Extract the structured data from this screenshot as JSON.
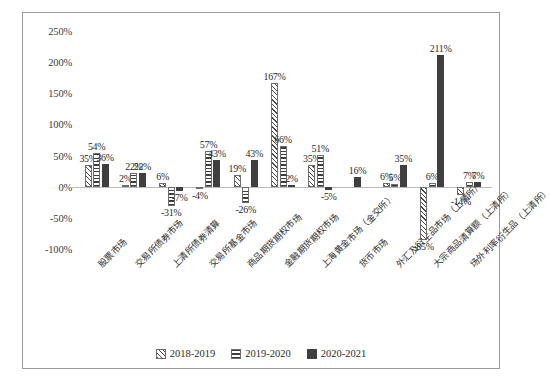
{
  "chart_data": {
    "type": "bar",
    "title": "",
    "subtitle": "",
    "xlabel": "",
    "ylabel": "",
    "ylim": [
      -100,
      250
    ],
    "ytick_labels": [
      "250%",
      "200%",
      "150%",
      "100%",
      "50%",
      "0%",
      "-50%",
      "-100%"
    ],
    "ytick_values": [
      250,
      200,
      150,
      100,
      50,
      0,
      -50,
      -100
    ],
    "grid": false,
    "legend_position": "bottom",
    "categories": [
      "股票市场",
      "交易所债券市场",
      "上清所债券清算",
      "交易所基金市场",
      "商品期货期权市场",
      "金融期货期权市场",
      "上海黄金市场（金交所）",
      "货币市场",
      "外汇及衍生品市场（上清所）",
      "大宗商品清算额（上清所）",
      "场外利率衍生品（上清所）"
    ],
    "series": [
      {
        "name": "2018-2019",
        "pattern": "diagonal-hatch",
        "values": [
          35,
          2,
          6,
          -4,
          19,
          167,
          35,
          null,
          6,
          -85,
          -14
        ],
        "labels": [
          "35%",
          "2%",
          "6%",
          "-4%",
          "19%",
          "167%",
          "35%",
          "",
          "6%",
          "-85%",
          "-14%"
        ]
      },
      {
        "name": "2019-2020",
        "pattern": "horizontal-hatch",
        "values": [
          54,
          22,
          -31,
          57,
          -26,
          66,
          51,
          null,
          5,
          6,
          7
        ],
        "labels": [
          "54%",
          "22%",
          "-31%",
          "57%",
          "-26%",
          "66%",
          "51%",
          "",
          "5%",
          "6%",
          "7%"
        ]
      },
      {
        "name": "2020-2021",
        "pattern": "solid",
        "values": [
          36,
          22,
          -7,
          43,
          43,
          2,
          -5,
          16,
          35,
          211,
          7
        ],
        "labels": [
          "36%",
          "22%",
          "-7%",
          "43%",
          "43%",
          "2%",
          "-5%",
          "16%",
          "35%",
          "211%",
          "7%"
        ]
      }
    ],
    "colors": {
      "series_2018_2019": "#6d6d6d",
      "series_2019_2020": "#3d3d3d",
      "series_2020_2021": "#3f3f3f",
      "axis": "#b9b9b9",
      "frame": "#9a9a9a",
      "text": "#2b2b2b"
    }
  }
}
